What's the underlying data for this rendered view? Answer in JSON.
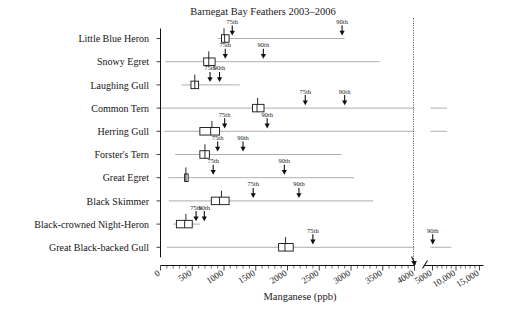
{
  "chart_data": {
    "type": "box",
    "title": "Barnegat Bay Feathers 2003–2006",
    "xlabel": "Manganese (ppb)",
    "ylabel": "",
    "grid": false,
    "legend": false,
    "axis_break": {
      "at": 4000,
      "note": "scale changes after 4000; upper segment runs 4000–15,000"
    },
    "xticks_lower": [
      0,
      500,
      1000,
      1500,
      2000,
      2500,
      3000,
      3500,
      4000
    ],
    "xticks_lower_labels": [
      "0",
      "500",
      "1000",
      "1500",
      "2000",
      "2500",
      "3000",
      "3500",
      "4000"
    ],
    "xticks_upper": [
      5000,
      10000,
      15000
    ],
    "xticks_upper_labels": [
      "5000",
      "10,000",
      "15,000"
    ],
    "xlim_lower": [
      0,
      4000
    ],
    "xlim_upper": [
      4000,
      16000
    ],
    "categories": [
      "Little Blue Heron",
      "Snowy Egret",
      "Laughing Gull",
      "Common Tern",
      "Herring Gull",
      "Forster's Tern",
      "Great Egret",
      "Black Skimmer",
      "Black-crowned Night-Heron",
      "Great Black-backed Gull"
    ],
    "percentile_marker_labels": [
      "75th",
      "90th"
    ],
    "series": [
      {
        "name": "Little Blue Heron",
        "q1": 960,
        "median": 1010,
        "q3": 1080,
        "whisker_low": 930,
        "whisker_high": 1090,
        "tick_top": 1000,
        "line_start": 900,
        "line_end": 2900,
        "p75": 1130,
        "p90": 2860,
        "p75_label": "75th",
        "p90_label": "90th",
        "upper_line": false
      },
      {
        "name": "Snowy Egret",
        "q1": 680,
        "median": 760,
        "q3": 860,
        "whisker_low": 640,
        "whisker_high": 880,
        "tick_top": 760,
        "line_start": 80,
        "line_end": 3450,
        "p75": 1020,
        "p90": 1620,
        "p75_label": "75th",
        "p90_label": "90th",
        "upper_line": false
      },
      {
        "name": "Laughing Gull",
        "q1": 480,
        "median": 540,
        "q3": 600,
        "whisker_low": 450,
        "whisker_high": 620,
        "tick_top": 540,
        "line_start": 330,
        "line_end": 1250,
        "p75": 780,
        "p90": 930,
        "p75_label": "75th",
        "p90_label": "90th",
        "upper_line": false
      },
      {
        "name": "Common Tern",
        "q1": 1450,
        "median": 1520,
        "q3": 1630,
        "whisker_low": 1430,
        "whisker_high": 1660,
        "tick_top": 1530,
        "line_start": 10,
        "line_end": 4000,
        "p75": 2280,
        "p90": 2900,
        "p75_label": "75th",
        "p90_label": "90th",
        "upper_line": true,
        "upper_line_start": 4350,
        "upper_line_end": 8100
      },
      {
        "name": "Herring Gull",
        "q1": 620,
        "median": 790,
        "q3": 930,
        "whisker_low": 600,
        "whisker_high": 950,
        "tick_top": 810,
        "line_start": 60,
        "line_end": 4000,
        "p75": 1010,
        "p90": 1680,
        "p75_label": "75th",
        "p90_label": "90th",
        "upper_line": true,
        "upper_line_start": 4350,
        "upper_line_end": 8100
      },
      {
        "name": "Forster's Tern",
        "q1": 620,
        "median": 700,
        "q3": 770,
        "whisker_low": 600,
        "whisker_high": 790,
        "tick_top": 700,
        "line_start": 230,
        "line_end": 2850,
        "p75": 900,
        "p90": 1300,
        "p75_label": "75th",
        "p90_label": "90th",
        "upper_line": false
      },
      {
        "name": "Great Egret",
        "q1": 380,
        "median": 400,
        "q3": 430,
        "whisker_low": 370,
        "whisker_high": 440,
        "tick_top": 400,
        "line_start": 120,
        "line_end": 3050,
        "p75": 830,
        "p90": 1950,
        "p75_label": "75th",
        "p90_label": "90th",
        "upper_line": false
      },
      {
        "name": "Black Skimmer",
        "q1": 800,
        "median": 930,
        "q3": 1080,
        "whisker_low": 780,
        "whisker_high": 1100,
        "tick_top": 960,
        "line_start": 130,
        "line_end": 3350,
        "p75": 1460,
        "p90": 2180,
        "p75_label": "75th",
        "p90_label": "90th",
        "upper_line": false
      },
      {
        "name": "Black-crowned Night-Heron",
        "q1": 250,
        "median": 380,
        "q3": 500,
        "whisker_low": 230,
        "whisker_high": 520,
        "tick_top": 400,
        "line_start": 200,
        "line_end": 620,
        "p75": 560,
        "p90": 690,
        "p75_label": "75th",
        "p90_label": "90th",
        "upper_line": false
      },
      {
        "name": "Great Black-backed Gull",
        "q1": 1860,
        "median": 1960,
        "q3": 2090,
        "whisker_low": 1840,
        "whisker_high": 2110,
        "tick_top": 1970,
        "line_start": 100,
        "line_end": 4000,
        "p75": 2400,
        "p90": 5050,
        "p75_label": "75th",
        "p90_label": "90th",
        "upper_line": true,
        "upper_line_start": 4350,
        "upper_line_end": 9000,
        "p90_on_upper": true
      }
    ]
  }
}
